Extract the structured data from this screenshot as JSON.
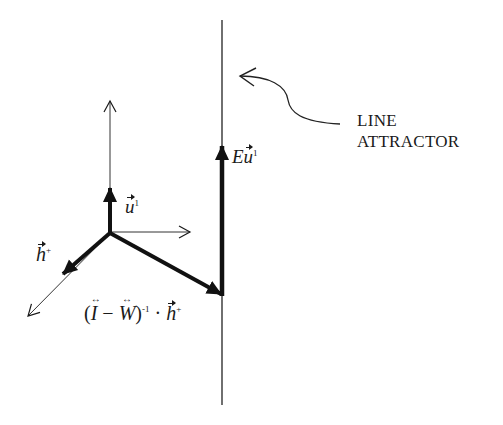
{
  "diagram": {
    "annotation": {
      "line1": "LINE",
      "line2": "ATTRACTOR"
    },
    "labels": {
      "u_vec": {
        "base": "u",
        "sup": "1"
      },
      "h_vec": {
        "base": "h",
        "sup": "+"
      },
      "E_u": {
        "prefix": "E",
        "base": "u",
        "sup": "1"
      },
      "projection": {
        "open": "(",
        "I": "I",
        "minus": " − ",
        "W": "W",
        "close": ")",
        "exp": "-1",
        "dot": " · ",
        "h": "h",
        "h_sup": "+"
      }
    },
    "colors": {
      "ink": "#1a1a1a",
      "background": "#ffffff"
    }
  }
}
